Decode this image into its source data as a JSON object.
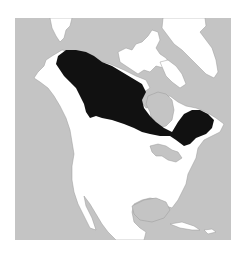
{
  "map": {
    "subject": "North America range map",
    "region_highlighted": "boreal forest belt (Alaska to Labrador)",
    "colors": {
      "ocean": "#c4c4c4",
      "land": "#ffffff",
      "range": "#111111",
      "background": "#ffffff"
    },
    "features": [
      "Alaska",
      "Canadian Arctic Archipelago",
      "Greenland",
      "Hudson Bay",
      "Great Lakes",
      "Gulf of Mexico",
      "Caribbean islands",
      "Baja California"
    ]
  }
}
